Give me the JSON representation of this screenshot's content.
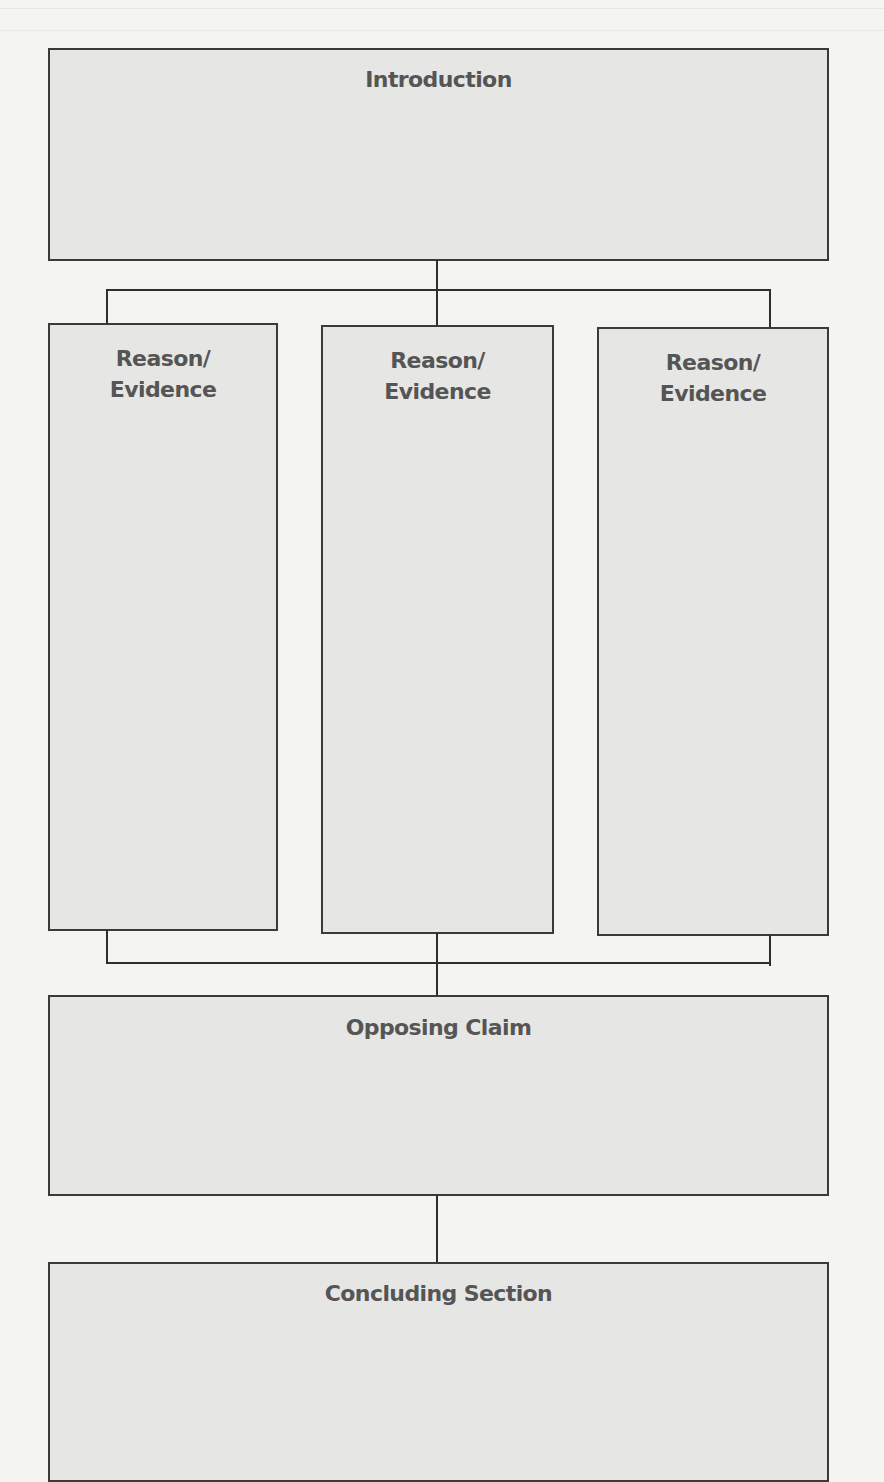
{
  "diagram": {
    "type": "essay-structure-graphic-organizer",
    "colors": {
      "page": "#f4f4f3",
      "box_fill": "#e6e6e5",
      "box_border": "#3a3a3a",
      "connector": "#2e2e2e",
      "label_text": "#555555"
    },
    "nodes": {
      "introduction": {
        "label": "Introduction"
      },
      "reasons": [
        {
          "line1": "Reason/",
          "line2": "Evidence"
        },
        {
          "line1": "Reason/",
          "line2": "Evidence"
        },
        {
          "line1": "Reason/",
          "line2": "Evidence"
        }
      ],
      "opposing_claim": {
        "label": "Opposing Claim"
      },
      "concluding_section": {
        "label": "Concluding Section"
      }
    },
    "edges": [
      {
        "from": "Introduction",
        "to": "Reason/Evidence 1"
      },
      {
        "from": "Introduction",
        "to": "Reason/Evidence 2"
      },
      {
        "from": "Introduction",
        "to": "Reason/Evidence 3"
      },
      {
        "from": "Reason/Evidence 1",
        "to": "Opposing Claim"
      },
      {
        "from": "Reason/Evidence 2",
        "to": "Opposing Claim"
      },
      {
        "from": "Reason/Evidence 3",
        "to": "Opposing Claim"
      },
      {
        "from": "Opposing Claim",
        "to": "Concluding Section"
      }
    ]
  }
}
